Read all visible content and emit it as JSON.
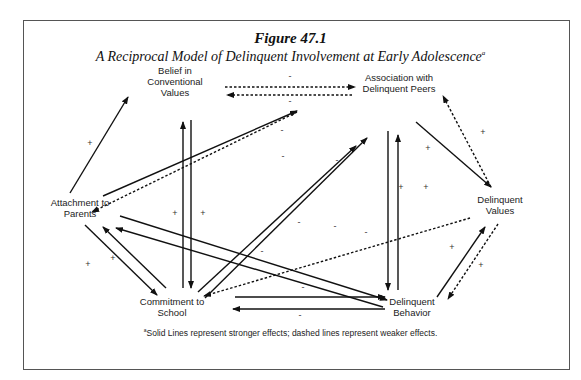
{
  "figure": {
    "title": "Figure 47.1",
    "subtitle": "A Reciprocal Model of Delinquent Involvement at Early Adolescence",
    "subtitle_marker": "a",
    "footnote_marker": "a",
    "footnote": "Solid Lines represent stronger effects; dashed lines represent weaker effects."
  },
  "nodes": [
    {
      "id": "belief",
      "lines": [
        "Belief in",
        "Conventional",
        "Values"
      ]
    },
    {
      "id": "peers",
      "lines": [
        "Association with",
        "Delinquent Peers"
      ]
    },
    {
      "id": "parents",
      "lines": [
        "Attachment to",
        "Parents"
      ]
    },
    {
      "id": "values",
      "lines": [
        "Delinquent",
        "Values"
      ]
    },
    {
      "id": "school",
      "lines": [
        "Commitment to",
        "School"
      ]
    },
    {
      "id": "behavior",
      "lines": [
        "Delinquent",
        "Behavior"
      ]
    }
  ],
  "edges": [
    {
      "from": "belief",
      "to": "peers",
      "style": "dashed",
      "sign": "-"
    },
    {
      "from": "peers",
      "to": "belief",
      "style": "dashed",
      "sign": "-"
    },
    {
      "from": "parents",
      "to": "belief",
      "style": "solid",
      "sign": "+"
    },
    {
      "from": "parents",
      "to": "peers",
      "style": "solid",
      "sign": "-"
    },
    {
      "from": "peers",
      "to": "parents",
      "style": "dashed",
      "sign": "-"
    },
    {
      "from": "belief",
      "to": "school",
      "style": "solid",
      "sign": "+"
    },
    {
      "from": "school",
      "to": "belief",
      "style": "solid",
      "sign": "+"
    },
    {
      "from": "parents",
      "to": "school",
      "style": "solid",
      "sign": "+"
    },
    {
      "from": "school",
      "to": "parents",
      "style": "solid",
      "sign": "+"
    },
    {
      "from": "parents",
      "to": "behavior",
      "style": "solid",
      "sign": "-"
    },
    {
      "from": "behavior",
      "to": "parents",
      "style": "solid",
      "sign": "-"
    },
    {
      "from": "school",
      "to": "peers",
      "style": "solid",
      "sign": "-"
    },
    {
      "from": "peers",
      "to": "school",
      "style": "solid",
      "sign": "-"
    },
    {
      "from": "peers",
      "to": "behavior",
      "style": "solid",
      "sign": "+"
    },
    {
      "from": "behavior",
      "to": "peers",
      "style": "solid",
      "sign": "+"
    },
    {
      "from": "peers",
      "to": "values",
      "style": "solid",
      "sign": "+"
    },
    {
      "from": "values",
      "to": "peers",
      "style": "dashed",
      "sign": "+"
    },
    {
      "from": "values",
      "to": "school",
      "style": "dashed",
      "sign": "-"
    },
    {
      "from": "behavior",
      "to": "values",
      "style": "solid",
      "sign": "+"
    },
    {
      "from": "values",
      "to": "behavior",
      "style": "dashed",
      "sign": "+"
    },
    {
      "from": "school",
      "to": "behavior",
      "style": "solid",
      "sign": "-"
    },
    {
      "from": "behavior",
      "to": "school",
      "style": "solid",
      "sign": "-"
    }
  ]
}
